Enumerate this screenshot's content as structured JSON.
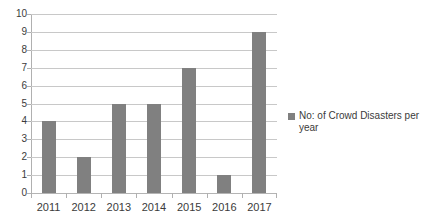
{
  "chart_data": {
    "type": "bar",
    "title": "",
    "xlabel": "",
    "ylabel": "",
    "categories": [
      "2011",
      "2012",
      "2013",
      "2014",
      "2015",
      "2016",
      "2017"
    ],
    "values": [
      4,
      2,
      5,
      5,
      7,
      1,
      9
    ],
    "series": [
      {
        "name": "No: of Crowd Disasters per year",
        "values": [
          4,
          2,
          5,
          5,
          7,
          1,
          9
        ]
      }
    ],
    "ylim": [
      0,
      10
    ],
    "y_ticks": [
      0,
      1,
      2,
      3,
      4,
      5,
      6,
      7,
      8,
      9,
      10
    ],
    "y_tick_labels": [
      "0",
      "1",
      "2",
      "3",
      "4",
      "5",
      "6",
      "7",
      "8",
      "9",
      "10"
    ],
    "grid": true,
    "legend_position": "right",
    "bar_color": "#808080",
    "gridline_color": "#c8c8c8",
    "axis_color": "#b0b0b0",
    "background_color": "#ffffff"
  },
  "legend": {
    "entries": [
      {
        "label": "No: of Crowd Disasters per year",
        "color": "#808080"
      }
    ]
  }
}
